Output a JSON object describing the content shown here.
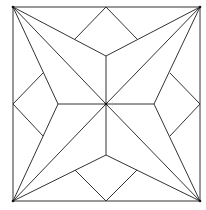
{
  "diagram": {
    "title": "",
    "stroke_color": "#333333",
    "background_color": "#ffffff",
    "square": {
      "x1": 13,
      "y1": 7,
      "x2": 200,
      "y2": 201
    },
    "center": [
      106,
      104
    ],
    "corners": [
      [
        13,
        7
      ],
      [
        200,
        7
      ],
      [
        200,
        201
      ],
      [
        13,
        201
      ]
    ],
    "star_inner_points": [
      [
        106,
        56
      ],
      [
        154,
        104
      ],
      [
        106,
        155
      ],
      [
        58,
        104
      ]
    ],
    "edge_midpoints": [
      [
        106,
        7
      ],
      [
        200,
        104
      ],
      [
        106,
        201
      ],
      [
        13,
        104
      ]
    ],
    "diamond_side_points": [
      [
        75,
        39
      ],
      [
        137,
        39
      ],
      [
        170,
        73
      ],
      [
        170,
        136
      ],
      [
        137,
        170
      ],
      [
        75,
        170
      ],
      [
        43,
        136
      ],
      [
        43,
        73
      ]
    ]
  }
}
